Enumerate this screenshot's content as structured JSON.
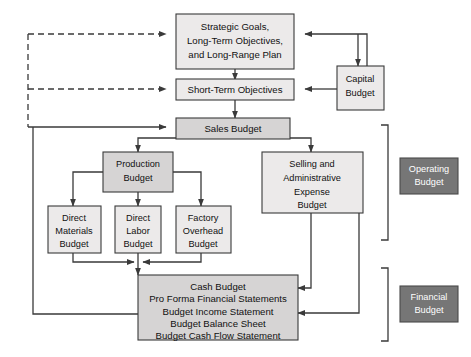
{
  "diagram": {
    "colors": {
      "box_light": "#eceaea",
      "box_mid": "#d6d4d4",
      "box_dark": "#767676",
      "line": "#3a3a3a",
      "text": "#111111",
      "text_inverse": "#ffffff",
      "background": "#ffffff"
    },
    "nodes": {
      "strategic_goals": {
        "lines": [
          "Strategic Goals,",
          "Long-Term Objectives,",
          "and Long-Range Plan"
        ],
        "shade": "light"
      },
      "short_term_objectives": {
        "lines": [
          "Short-Term Objectives"
        ],
        "shade": "light"
      },
      "capital_budget": {
        "lines": [
          "Capital",
          "Budget"
        ],
        "shade": "light"
      },
      "sales_budget": {
        "lines": [
          "Sales Budget"
        ],
        "shade": "mid"
      },
      "production_budget": {
        "lines": [
          "Production",
          "Budget"
        ],
        "shade": "mid"
      },
      "selling_admin_budget": {
        "lines": [
          "Selling and",
          "Administrative",
          "Expense",
          "Budget"
        ],
        "shade": "light"
      },
      "direct_materials_budget": {
        "lines": [
          "Direct",
          "Materials",
          "Budget"
        ],
        "shade": "light"
      },
      "direct_labor_budget": {
        "lines": [
          "Direct",
          "Labor",
          "Budget"
        ],
        "shade": "light"
      },
      "factory_overhead_budget": {
        "lines": [
          "Factory",
          "Overhead",
          "Budget"
        ],
        "shade": "light"
      },
      "cash_budget": {
        "lines": [
          "Cash Budget",
          "Pro Forma Financial Statements",
          "Budget Income Statement",
          "Budget Balance Sheet",
          "Budget Cash Flow Statement"
        ],
        "shade": "mid"
      },
      "operating_budget_label": {
        "lines": [
          "Operating",
          "Budget"
        ],
        "shade": "dark"
      },
      "financial_budget_label": {
        "lines": [
          "Financial",
          "Budget"
        ],
        "shade": "dark"
      }
    }
  }
}
